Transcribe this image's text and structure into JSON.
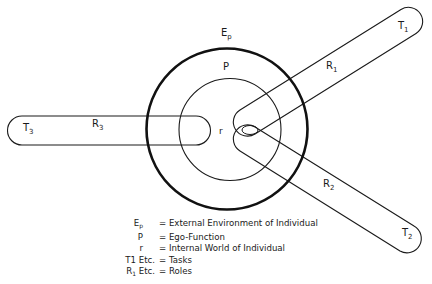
{
  "diagram": {
    "type": "role-task-ego model",
    "nodes": {
      "outer_circle": {
        "label": "E",
        "label_sub": "p",
        "meaning": "External Environment of Individual",
        "cx": 227,
        "cy": 129,
        "r": 80
      },
      "inner_circle": {
        "label": "P",
        "meaning": "Ego-Function",
        "cx": 230,
        "cy": 129,
        "r": 51
      },
      "core": {
        "label": "r",
        "meaning": "Internal World of Individual"
      }
    },
    "bands": [
      {
        "role_label": "R",
        "role_sub": "1",
        "task_label": "T",
        "task_sub": "1",
        "direction": "upper-right"
      },
      {
        "role_label": "R",
        "role_sub": "2",
        "task_label": "T",
        "task_sub": "2",
        "direction": "lower-right"
      },
      {
        "role_label": "R",
        "role_sub": "3",
        "task_label": "T",
        "task_sub": "3",
        "direction": "left"
      }
    ]
  },
  "legend": [
    {
      "key": "E",
      "key_sub": "p",
      "text": "= External Environment of Individual"
    },
    {
      "key": "P",
      "key_sub": "",
      "text": "= Ego-Function"
    },
    {
      "key": "r",
      "key_sub": "",
      "text": "= Internal World of Individual"
    },
    {
      "key": "T1 Etc.",
      "key_sub": "",
      "text": "= Tasks"
    },
    {
      "key": "R",
      "key_sub": "1",
      "key_suffix": " Etc.",
      "text": "= Roles"
    }
  ]
}
